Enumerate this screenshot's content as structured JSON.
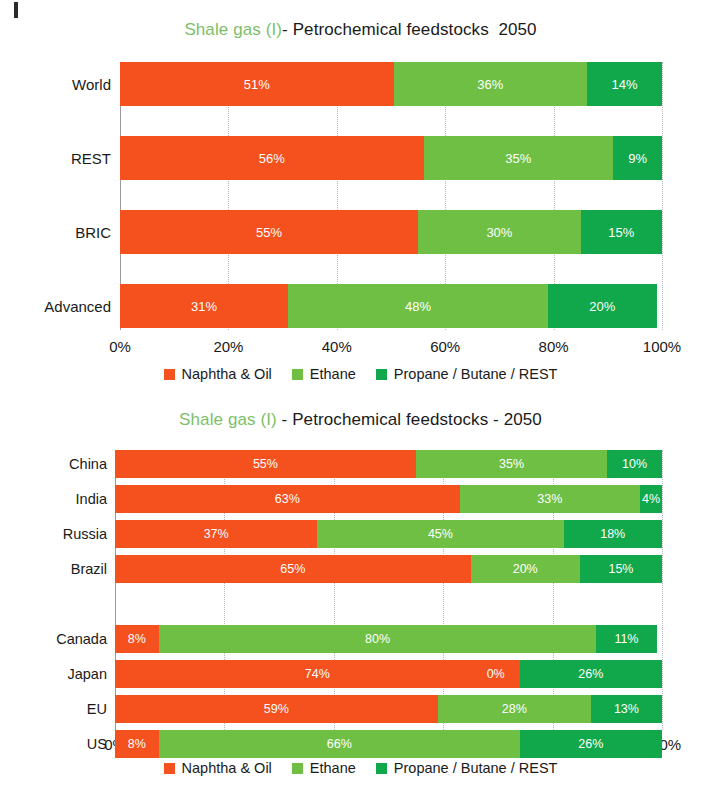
{
  "colors": {
    "naphtha": "#F4511E",
    "ethane": "#6FBF44",
    "propane": "#10A84A",
    "title_green": "#7cbf6a",
    "title_dark": "#1a1a1a",
    "grid": "#b9b9b9",
    "axis": "#9a9a9a",
    "label_text": "#ffffff"
  },
  "legend": {
    "items": [
      {
        "label": "Naphtha & Oil",
        "swatch": "#F4511E",
        "icon": "square-swatch-icon"
      },
      {
        "label": "Ethane",
        "swatch": "#6FBF44",
        "icon": "square-swatch-icon"
      },
      {
        "label": "Propane / Butane / REST",
        "swatch": "#10A84A",
        "icon": "square-swatch-icon"
      }
    ]
  },
  "xaxis": {
    "ticks": [
      "0%",
      "20%",
      "40%",
      "60%",
      "80%",
      "100%"
    ],
    "tick_values": [
      0,
      20,
      40,
      60,
      80,
      100
    ]
  },
  "top": {
    "title_green": "Shale gas (I)",
    "title_dark": "- Petrochemical feedstocks  2050"
  },
  "bottom": {
    "title_green": "Shale gas (I)",
    "title_dark": " - Petrochemical feedstocks - 2050"
  },
  "chart_data": [
    {
      "type": "bar",
      "orientation": "horizontal",
      "stacked": true,
      "normalized_percent": true,
      "title": "Shale gas (I)- Petrochemical feedstocks  2050",
      "xlabel": "",
      "ylabel": "",
      "xlim": [
        0,
        100
      ],
      "xticks": [
        0,
        20,
        40,
        60,
        80,
        100
      ],
      "xticklabels": [
        "0%",
        "20%",
        "40%",
        "60%",
        "80%",
        "100%"
      ],
      "grid": true,
      "legend_position": "bottom",
      "categories": [
        "World",
        "REST",
        "BRIC",
        "Advanced"
      ],
      "series": [
        {
          "name": "Naphtha & Oil",
          "color": "#F4511E",
          "values": [
            51,
            56,
            55,
            31
          ],
          "labels": [
            "51%",
            "56%",
            "55%",
            "31%"
          ]
        },
        {
          "name": "Ethane",
          "color": "#6FBF44",
          "values": [
            36,
            35,
            30,
            48
          ],
          "labels": [
            "36%",
            "35%",
            "30%",
            "48%"
          ]
        },
        {
          "name": "Propane / Butane / REST",
          "color": "#10A84A",
          "values": [
            14,
            9,
            15,
            20
          ],
          "labels": [
            "14%",
            "9%",
            "15%",
            "20%"
          ]
        }
      ]
    },
    {
      "type": "bar",
      "orientation": "horizontal",
      "stacked": true,
      "normalized_percent": true,
      "title": "Shale gas (I)  - Petrochemical feedstocks - 2050",
      "xlabel": "",
      "ylabel": "",
      "xlim": [
        0,
        100
      ],
      "xticks": [
        0,
        20,
        40,
        60,
        80,
        100
      ],
      "xticklabels": [
        "0%",
        "20%",
        "40%",
        "60%",
        "80%",
        "100%"
      ],
      "grid": true,
      "legend_position": "bottom",
      "categories": [
        "China",
        "India",
        "Russia",
        "Brazil",
        "",
        "Canada",
        "Japan",
        "EU",
        "US"
      ],
      "series": [
        {
          "name": "Naphtha & Oil",
          "color": "#F4511E",
          "values": [
            55,
            63,
            37,
            65,
            null,
            8,
            74,
            59,
            8
          ],
          "labels": [
            "55%",
            "63%",
            "37%",
            "65%",
            "",
            "8%",
            "74%",
            "59%",
            "8%"
          ]
        },
        {
          "name": "Ethane",
          "color": "#6FBF44",
          "values": [
            35,
            33,
            45,
            20,
            null,
            80,
            0,
            28,
            66
          ],
          "labels": [
            "35%",
            "33%",
            "45%",
            "20%",
            "",
            "80%",
            "0%",
            "28%",
            "66%"
          ]
        },
        {
          "name": "Propane / Butane / REST",
          "color": "#10A84A",
          "values": [
            10,
            4,
            18,
            15,
            null,
            11,
            26,
            13,
            26
          ],
          "labels": [
            "10%",
            "4%",
            "18%",
            "15%",
            "",
            "11%",
            "26%",
            "13%",
            "26%"
          ]
        }
      ]
    }
  ]
}
